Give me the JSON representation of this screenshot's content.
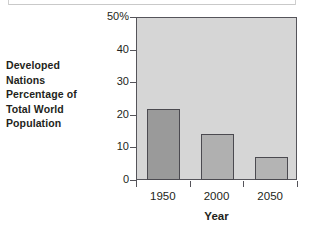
{
  "chart_data": {
    "type": "bar",
    "title": "",
    "categories": [
      "1950",
      "2000",
      "2050"
    ],
    "values": [
      22,
      14.5,
      7.4
    ],
    "series": [
      {
        "name": "Developed Nations Percentage of Total World Population",
        "values": [
          22,
          14.5,
          7.4
        ]
      }
    ],
    "xlabel": "Year",
    "ylabel": "Developed Nations Percentage of Total World Population",
    "ylim": [
      0,
      50
    ],
    "yticks": [
      0,
      10,
      20,
      30,
      40,
      50
    ],
    "ytick_labels": [
      "0",
      "10",
      "20",
      "30",
      "40",
      "50%"
    ],
    "grid": false,
    "legend": "none",
    "plot_background": "#d6d6d6",
    "axis_color": "#55545a",
    "bar_colors": [
      "#9a9a9a",
      "#b0b0b0",
      "#b4b4b4"
    ],
    "bar_border_color": "#4b4a50"
  },
  "y_caption": {
    "lines": [
      "Developed",
      "Nations",
      "Percentage of",
      "Total World",
      "Population"
    ]
  },
  "x_axis": {
    "title": "Year",
    "tick_labels": [
      "1950",
      "2000",
      "2050"
    ]
  },
  "y_axis": {
    "tick_labels": [
      "50%",
      "40",
      "30",
      "20",
      "10",
      "0"
    ]
  }
}
